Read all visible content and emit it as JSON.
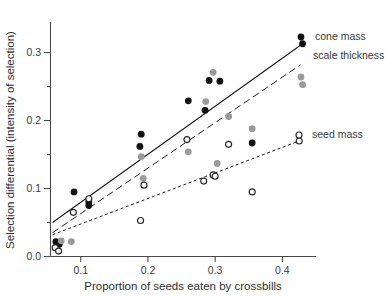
{
  "chart_data": {
    "type": "scatter",
    "title": "",
    "xlabel": "Proportion of seeds eaten by crossbills",
    "ylabel": "Selection differential (intensity of selection)",
    "xlim": [
      0.055,
      0.45
    ],
    "ylim": [
      0.0,
      0.345
    ],
    "xticks": [
      0.1,
      0.2,
      0.3,
      0.4
    ],
    "xticklabels": [
      "0.1",
      "0.2",
      "0.3",
      "0.4"
    ],
    "yticks": [
      0.0,
      0.1,
      0.2,
      0.3
    ],
    "yticklabels": [
      "0.0",
      "0.1",
      "0.2",
      "0.3"
    ],
    "yminorticks": [
      0.05,
      0.15,
      0.25
    ],
    "grid": false,
    "legend_position": "right-inline",
    "series": [
      {
        "name": "cone mass",
        "label": "cone mass",
        "marker": "filled-circle",
        "color": "#111111",
        "line_style": "solid",
        "points": [
          {
            "x": 0.063,
            "y": 0.022
          },
          {
            "x": 0.068,
            "y": 0.018
          },
          {
            "x": 0.09,
            "y": 0.095
          },
          {
            "x": 0.112,
            "y": 0.08
          },
          {
            "x": 0.112,
            "y": 0.075
          },
          {
            "x": 0.188,
            "y": 0.162
          },
          {
            "x": 0.19,
            "y": 0.18
          },
          {
            "x": 0.26,
            "y": 0.229
          },
          {
            "x": 0.285,
            "y": 0.215
          },
          {
            "x": 0.291,
            "y": 0.259
          },
          {
            "x": 0.307,
            "y": 0.258
          },
          {
            "x": 0.355,
            "y": 0.167
          },
          {
            "x": 0.43,
            "y": 0.313
          }
        ],
        "fit_line": {
          "x0": 0.058,
          "y0": 0.05,
          "x1": 0.43,
          "y1": 0.313
        }
      },
      {
        "name": "scale thickness",
        "label": "scale thickness",
        "marker": "filled-circle",
        "color": "#9a9a9a",
        "line_style": "dashed",
        "points": [
          {
            "x": 0.071,
            "y": 0.023
          },
          {
            "x": 0.086,
            "y": 0.022
          },
          {
            "x": 0.19,
            "y": 0.147
          },
          {
            "x": 0.193,
            "y": 0.115
          },
          {
            "x": 0.26,
            "y": 0.154
          },
          {
            "x": 0.286,
            "y": 0.228
          },
          {
            "x": 0.297,
            "y": 0.271
          },
          {
            "x": 0.303,
            "y": 0.137
          },
          {
            "x": 0.32,
            "y": 0.206
          },
          {
            "x": 0.355,
            "y": 0.188
          },
          {
            "x": 0.43,
            "y": 0.253
          }
        ],
        "fit_line": {
          "x0": 0.058,
          "y0": 0.035,
          "x1": 0.427,
          "y1": 0.282
        }
      },
      {
        "name": "seed mass",
        "label": "seed mass",
        "marker": "open-circle",
        "color": "#262626",
        "line_style": "dotted",
        "points": [
          {
            "x": 0.062,
            "y": 0.013
          },
          {
            "x": 0.067,
            "y": 0.008
          },
          {
            "x": 0.089,
            "y": 0.065
          },
          {
            "x": 0.112,
            "y": 0.085
          },
          {
            "x": 0.189,
            "y": 0.053
          },
          {
            "x": 0.194,
            "y": 0.105
          },
          {
            "x": 0.258,
            "y": 0.172
          },
          {
            "x": 0.283,
            "y": 0.111
          },
          {
            "x": 0.297,
            "y": 0.12
          },
          {
            "x": 0.3,
            "y": 0.118
          },
          {
            "x": 0.32,
            "y": 0.165
          },
          {
            "x": 0.355,
            "y": 0.095
          },
          {
            "x": 0.425,
            "y": 0.17
          }
        ],
        "fit_line": {
          "x0": 0.058,
          "y0": 0.032,
          "x1": 0.425,
          "y1": 0.17
        }
      }
    ]
  },
  "axes": {
    "x_title": "Proportion of seeds eaten by crossbills",
    "y_title": "Selection differential (intensity of selection)"
  },
  "labels": {
    "cone_mass": "cone mass",
    "scale_thickness": "scale thickness",
    "seed_mass": "seed mass",
    "y_0": "0.0",
    "y_1": "0.1",
    "y_2": "0.2",
    "y_3": "0.3",
    "x_1": "0.1",
    "x_2": "0.2",
    "x_3": "0.3",
    "x_4": "0.4"
  },
  "colors": {
    "cone_mass": "#111111",
    "scale_thickness": "#9a9a9a",
    "seed_mass": "#262626",
    "axis": "#4a4a4a",
    "background": "#ffffff"
  }
}
